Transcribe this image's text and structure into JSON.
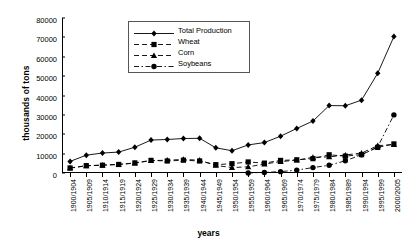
{
  "chart_data": {
    "type": "line",
    "title": "",
    "xlabel": "years",
    "ylabel": "thousands of tons",
    "ylim": [
      0,
      80000
    ],
    "ytick_values": [
      0,
      10000,
      20000,
      30000,
      40000,
      50000,
      60000,
      70000,
      80000
    ],
    "ytick_labels": [
      "0",
      "10000",
      "20000",
      "30000",
      "40000",
      "50000",
      "60000",
      "70000",
      "80000"
    ],
    "grid": false,
    "legend_position": "top-center-inside",
    "categories": [
      "1900/1904",
      "1905/1909",
      "1910/1914",
      "1915/1919",
      "1920/1924",
      "1925/1929",
      "1930/1934",
      "1935/1939",
      "1940/1944",
      "1945/1949",
      "1950/1954",
      "1955/1959",
      "1960/1964",
      "1965/1969",
      "1970/1974",
      "1975/1979",
      "1980/1984",
      "1985/1989",
      "1990/1994",
      "1995/1999",
      "2000/2005"
    ],
    "series": [
      {
        "name": "Total Production",
        "color": "#000000",
        "marker": "diamond",
        "dash": "solid",
        "values": [
          6000,
          9200,
          10300,
          10800,
          13300,
          17000,
          17300,
          17800,
          17900,
          13000,
          11500,
          14500,
          15700,
          19000,
          23000,
          26800,
          34800,
          34700,
          37600,
          51500,
          70400
        ]
      },
      {
        "name": "Wheat",
        "color": "#000000",
        "marker": "square",
        "dash": "dashed",
        "values": [
          2600,
          3800,
          4000,
          4400,
          5200,
          6500,
          6200,
          6600,
          6200,
          4300,
          4800,
          5700,
          5100,
          6500,
          6800,
          7400,
          9400,
          8700,
          9500,
          13200,
          15000
        ]
      },
      {
        "name": "Corn",
        "color": "#000000",
        "marker": "triangle",
        "dash": "dashed",
        "values": [
          2500,
          3700,
          4100,
          4400,
          5100,
          6400,
          6600,
          7000,
          6600,
          3900,
          2800,
          3200,
          4600,
          5900,
          6600,
          8100,
          8300,
          9300,
          10300,
          14100,
          14700
        ]
      },
      {
        "name": "Soybeans",
        "color": "#000000",
        "marker": "circle",
        "dash": "dashdot",
        "values": [
          0,
          0,
          0,
          0,
          0,
          0,
          0,
          0,
          0,
          0,
          0,
          0,
          300,
          700,
          1500,
          2800,
          4000,
          6300,
          9400,
          13500,
          30000
        ]
      }
    ]
  },
  "legend": {
    "items": [
      {
        "label": "Total Production"
      },
      {
        "label": "Wheat"
      },
      {
        "label": "Corn"
      },
      {
        "label": "Soybeans"
      }
    ]
  }
}
